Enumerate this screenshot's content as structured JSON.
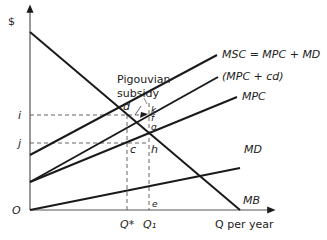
{
  "diagram": {
    "axes": {
      "y_label": "$",
      "x_label": "Q per year",
      "origin_label": "O"
    },
    "curves": {
      "msc": "MSC = MPC + MD",
      "mpc_cd": "(MPC + cd)",
      "mpc": "MPC",
      "md": "MD",
      "mb": "MB"
    },
    "annotation": {
      "line1": "Pigouvian",
      "line2": "subsidy"
    },
    "points": {
      "d": "d",
      "k": "k",
      "f": "f",
      "g": "g",
      "c": "c",
      "h": "h",
      "e": "e"
    },
    "y_ticks": {
      "i": "i",
      "j": "j"
    },
    "x_ticks": {
      "q_star": "Q*",
      "q1": "Q₁"
    },
    "colors": {
      "line": "#1a1a1a",
      "dashed": "#555555",
      "background": "#ffffff"
    }
  }
}
